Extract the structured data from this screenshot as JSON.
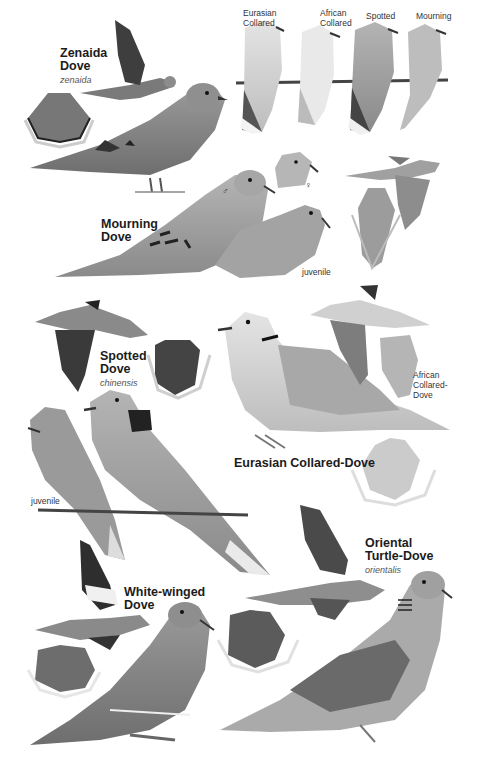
{
  "plate": {
    "species": [
      {
        "name_line1": "Zenaida",
        "name_line2": "Dove",
        "scientific": "zenaida"
      },
      {
        "name_line1": "Mourning",
        "name_line2": "Dove"
      },
      {
        "name_line1": "Spotted",
        "name_line2": "Dove",
        "scientific": "chinensis"
      },
      {
        "name": "Eurasian Collared-Dove"
      },
      {
        "name_line1": "White-winged",
        "name_line2": "Dove"
      },
      {
        "name_line1": "Oriental",
        "name_line2": "Turtle-Dove",
        "scientific": "orientalis"
      }
    ],
    "perched_comparison": [
      {
        "line1": "Eurasian",
        "line2": "Collared"
      },
      {
        "line1": "African",
        "line2": "Collared"
      },
      {
        "line1": "Spotted"
      },
      {
        "line1": "Mourning"
      }
    ],
    "annotations": {
      "male_symbol": "♂",
      "female_symbol": "♀",
      "mourning_juvenile": "juvenile",
      "spotted_juvenile": "juvenile",
      "african_collared_line1": "African",
      "african_collared_line2": "Collared-",
      "african_collared_line3": "Dove"
    }
  }
}
